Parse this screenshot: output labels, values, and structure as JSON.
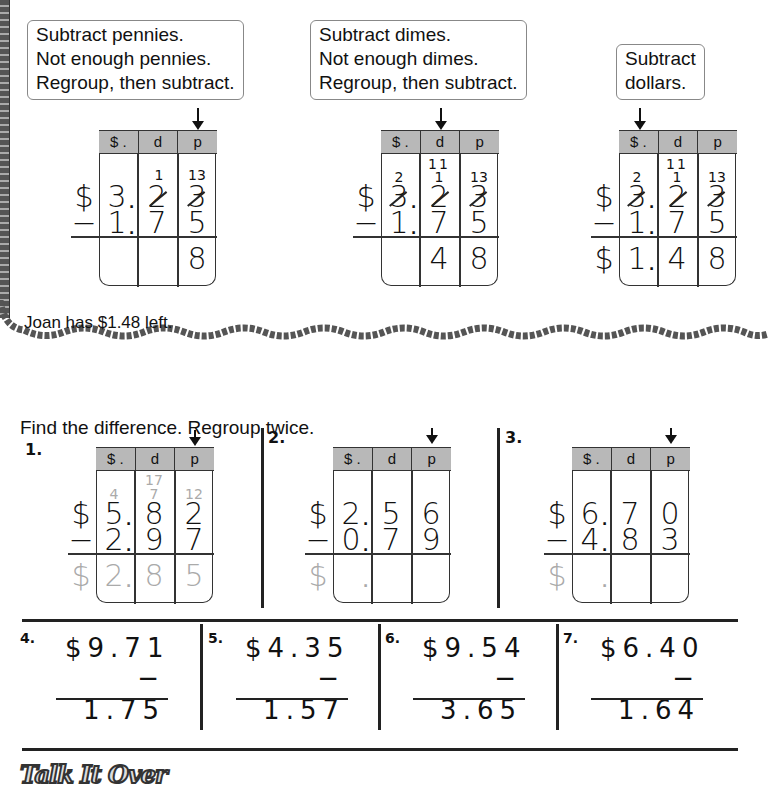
{
  "example": {
    "step1": {
      "callout": [
        "Subtract pennies.",
        "Not enough pennies.",
        "Regroup, then subtract."
      ],
      "headers": [
        "$ .",
        "d",
        "p"
      ],
      "top": {
        "dollars": "3",
        "dimes": "2",
        "pennies": "3",
        "dimes_regroup": "1",
        "pennies_regroup": "13"
      },
      "bottom": {
        "dollars": "1",
        "dimes": "7",
        "pennies": "5"
      },
      "answer": {
        "dollars": "",
        "dimes": "",
        "pennies": "8"
      },
      "sign_dollar": "$",
      "sign_minus": "−"
    },
    "step2": {
      "callout": [
        "Subtract dimes.",
        "Not enough dimes.",
        "Regroup, then subtract."
      ],
      "headers": [
        "$ .",
        "d",
        "p"
      ],
      "top": {
        "dollars": "3",
        "dimes": "2",
        "pennies": "3",
        "dollars_regroup": "2",
        "dimes_regroup": "11",
        "dimes_regroup_mid": "1",
        "pennies_regroup": "13"
      },
      "bottom": {
        "dollars": "1",
        "dimes": "7",
        "pennies": "5"
      },
      "answer": {
        "dollars": "",
        "dimes": "4",
        "pennies": "8"
      },
      "sign_dollar": "$",
      "sign_minus": "−"
    },
    "step3": {
      "callout": [
        "Subtract",
        "dollars."
      ],
      "headers": [
        "$ .",
        "d",
        "p"
      ],
      "top": {
        "dollars": "3",
        "dimes": "2",
        "pennies": "3",
        "dollars_regroup": "2",
        "dimes_regroup": "11",
        "dimes_regroup_mid": "1",
        "pennies_regroup": "13"
      },
      "bottom": {
        "dollars": "1",
        "dimes": "7",
        "pennies": "5"
      },
      "answer": {
        "dollars": "1",
        "dimes": "4",
        "pennies": "8"
      },
      "sign_dollar": "$",
      "sign_minus": "−"
    },
    "conclusion": "Joan has $1.48 left."
  },
  "instructions": "Find the difference. Regroup twice.",
  "problems_grid": [
    {
      "label": "1.",
      "headers": [
        "$ .",
        "d",
        "p"
      ],
      "top": [
        "5",
        "8",
        "2"
      ],
      "bottom": [
        "2",
        "9",
        "7"
      ],
      "regroup": [
        "4",
        "7",
        "12"
      ],
      "regroup_top_dimes": "17",
      "answer": [
        "2",
        "8",
        "5"
      ]
    },
    {
      "label": "2.",
      "headers": [
        "$ .",
        "d",
        "p"
      ],
      "top": [
        "2",
        "5",
        "6"
      ],
      "bottom": [
        "0",
        "7",
        "9"
      ],
      "answer": [
        "",
        "",
        ""
      ]
    },
    {
      "label": "3.",
      "headers": [
        "$ .",
        "d",
        "p"
      ],
      "top": [
        "6",
        "7",
        "0"
      ],
      "bottom": [
        "4",
        "8",
        "3"
      ],
      "answer": [
        "",
        "",
        ""
      ]
    }
  ],
  "problems_vertical": [
    {
      "label": "4.",
      "top": "$9.71",
      "bottom": "− 1.75"
    },
    {
      "label": "5.",
      "top": "$4.35",
      "bottom": "− 1.57"
    },
    {
      "label": "6.",
      "top": "$9.54",
      "bottom": "− 3.65"
    },
    {
      "label": "7.",
      "top": "$6.40",
      "bottom": "− 1.64"
    }
  ],
  "footer": {
    "logo": "Talk It Over"
  }
}
